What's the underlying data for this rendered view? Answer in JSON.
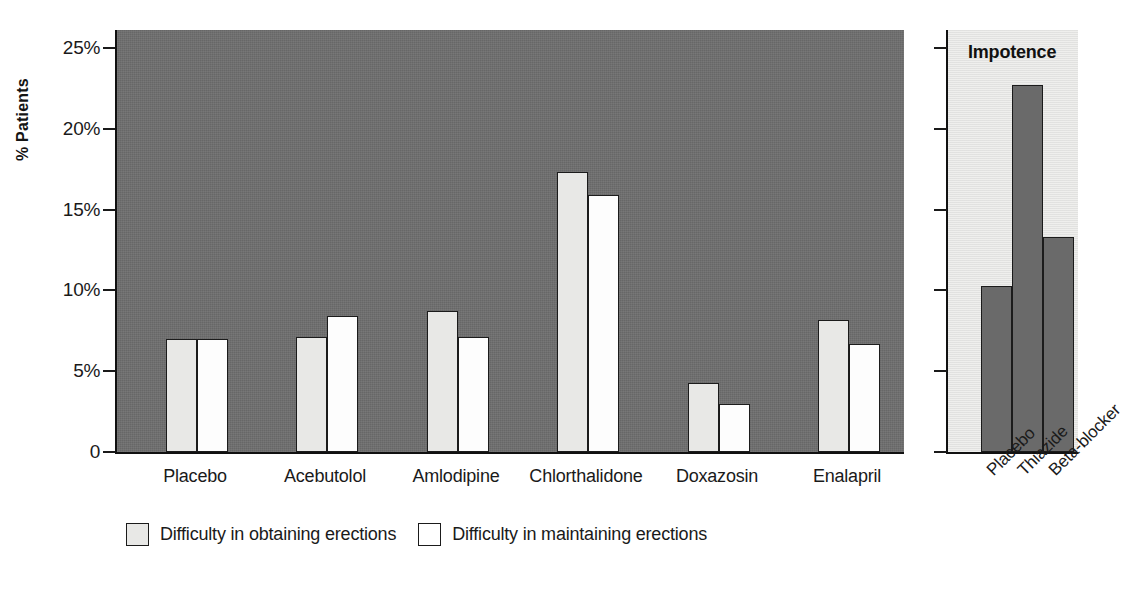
{
  "chart_data": {
    "type": "bar",
    "title": "",
    "xlabel": "",
    "ylabel": "% Patients",
    "ylim": [
      0,
      25
    ],
    "grid": false,
    "legend_position": "bottom",
    "y_ticks": [
      {
        "value": 25,
        "label": "25%"
      },
      {
        "value": 20,
        "label": "20%"
      },
      {
        "value": 15,
        "label": "15%"
      },
      {
        "value": 10,
        "label": "10%"
      },
      {
        "value": 5,
        "label": "5%"
      },
      {
        "value": 0,
        "label": "0"
      }
    ],
    "categories": [
      "Placebo",
      "Acebutolol",
      "Amlodipine",
      "Chlorthalidone",
      "Doxazosin",
      "Enalapril"
    ],
    "series": [
      {
        "name": "Difficulty in obtaining erections",
        "color": "#e8e8e6",
        "values": [
          7.0,
          7.1,
          8.7,
          17.3,
          4.3,
          8.2
        ]
      },
      {
        "name": "Difficulty in maintaining erections",
        "color": "#ffffff",
        "values": [
          7.0,
          8.4,
          7.1,
          15.9,
          3.0,
          6.7
        ]
      }
    ],
    "inset": {
      "type": "bar",
      "title": "Impotence",
      "ylim": [
        0,
        25
      ],
      "y_ticks": [
        25,
        20,
        15,
        10,
        5,
        0
      ],
      "categories": [
        "Placebo",
        "Thiazide",
        "Beta-blocker"
      ],
      "values": [
        10.3,
        22.7,
        13.3
      ],
      "color": "#6a6a6a"
    }
  },
  "colors": {
    "plot_background": "#6e6e6e",
    "inset_background": "#e6e6e4",
    "axis": "#111111",
    "series_light": "#e8e8e6",
    "series_white": "#ffffff",
    "inset_bar": "#6a6a6a"
  }
}
